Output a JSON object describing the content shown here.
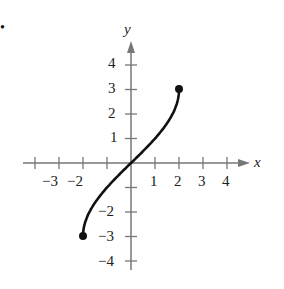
{
  "bullet": "•",
  "chart_data": {
    "type": "line",
    "title": "",
    "xlabel": "x",
    "ylabel": "y",
    "xlim": [
      -4.5,
      4.8
    ],
    "ylim": [
      -4.5,
      4.8
    ],
    "x_ticks": [
      -4,
      -3,
      -2,
      -1,
      1,
      2,
      3,
      4
    ],
    "x_tick_labels": [
      "-3",
      "-2",
      "1",
      "2",
      "3",
      "4"
    ],
    "y_ticks": [
      -4,
      -3,
      -2,
      -1,
      1,
      2,
      3,
      4
    ],
    "y_tick_labels": [
      "4",
      "3",
      "2",
      "1",
      "-2",
      "-3",
      "-4"
    ],
    "grid": false,
    "series": [
      {
        "name": "curve",
        "x": [
          -2,
          -1.9,
          -1.5,
          -1,
          -0.5,
          0,
          0.5,
          1,
          1.5,
          1.9,
          2
        ],
        "y": [
          -3,
          -2.2,
          -1.5,
          -0.95,
          -0.45,
          0,
          0.45,
          0.95,
          1.5,
          2.2,
          3
        ],
        "endpoints": [
          [
            -2,
            -3
          ],
          [
            2,
            3
          ]
        ],
        "endpoint_style": "closed"
      }
    ]
  },
  "labels": {
    "x_axis": "x",
    "y_axis": "y",
    "xt": [
      "−3",
      "−2",
      "1",
      "2",
      "3",
      "4"
    ],
    "yt": [
      "4",
      "3",
      "2",
      "1",
      "−2",
      "−3",
      "−4"
    ]
  }
}
